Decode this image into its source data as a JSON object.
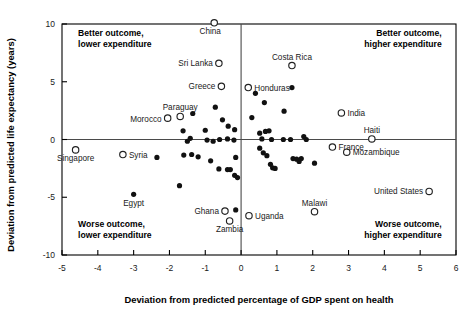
{
  "chart_data": {
    "type": "scatter",
    "title": "",
    "xlabel": "Deviation from predicted percentage of GDP spent on health",
    "ylabel": "Deviation from predicted life expectancy (years)",
    "xlim": [
      -5,
      6
    ],
    "ylim": [
      -10,
      10
    ],
    "xticks": [
      -5,
      -4,
      -3,
      -2,
      -1,
      0,
      1,
      2,
      3,
      4,
      5,
      6
    ],
    "yticks": [
      -10,
      -5,
      0,
      5,
      10
    ],
    "xticklabels": [
      "-5",
      "-4",
      "-3",
      "-2",
      "-1",
      "0",
      "1",
      "2",
      "3",
      "4",
      "5",
      "6"
    ],
    "yticklabels": [
      "-10",
      "-5",
      "0",
      "5",
      "10"
    ],
    "grid": false,
    "legend": null,
    "reference_lines": [
      {
        "axis": "x",
        "value": 0
      },
      {
        "axis": "y",
        "value": 0
      }
    ],
    "annotations": [
      {
        "text": "Better outcome,\nlower expenditure",
        "x": -4.55,
        "y": 9.0,
        "align": "start"
      },
      {
        "text": "Better outcome,\nhigher expenditure",
        "x": 5.6,
        "y": 9.0,
        "align": "end"
      },
      {
        "text": "Worse outcome,\nlower expenditure",
        "x": -4.55,
        "y": -7.6,
        "align": "start"
      },
      {
        "text": "Worse outcome,\nhigher expenditure",
        "x": 5.6,
        "y": -7.6,
        "align": "end"
      }
    ],
    "labeled_points": [
      {
        "name": "China",
        "x": -0.75,
        "y": 10.1,
        "marker": "open",
        "label_pos": "below-left"
      },
      {
        "name": "Sri Lanka",
        "x": -0.62,
        "y": 6.6,
        "marker": "open",
        "label_pos": "left"
      },
      {
        "name": "Costa Rica",
        "x": 1.42,
        "y": 6.4,
        "marker": "open",
        "label_pos": "above"
      },
      {
        "name": "Greece",
        "x": -0.55,
        "y": 4.6,
        "marker": "open",
        "label_pos": "left"
      },
      {
        "name": "Honduras",
        "x": 0.2,
        "y": 4.5,
        "marker": "open",
        "label_pos": "right"
      },
      {
        "name": "India",
        "x": 2.8,
        "y": 2.3,
        "marker": "open",
        "label_pos": "right"
      },
      {
        "name": "Paraguay",
        "x": -1.7,
        "y": 2.0,
        "marker": "open",
        "label_pos": "above"
      },
      {
        "name": "Morocco",
        "x": -2.05,
        "y": 1.85,
        "marker": "open",
        "label_pos": "left-below"
      },
      {
        "name": "Haiti",
        "x": 3.65,
        "y": 0.05,
        "marker": "open",
        "label_pos": "above"
      },
      {
        "name": "France",
        "x": 2.55,
        "y": -0.65,
        "marker": "open",
        "label_pos": "right"
      },
      {
        "name": "Singapore",
        "x": -4.62,
        "y": -0.9,
        "marker": "open",
        "label_pos": "below"
      },
      {
        "name": "Mozambique",
        "x": 2.95,
        "y": -1.1,
        "marker": "open",
        "label_pos": "right"
      },
      {
        "name": "Syria",
        "x": -3.3,
        "y": -1.3,
        "marker": "open",
        "label_pos": "right"
      },
      {
        "name": "United States",
        "x": 5.25,
        "y": -4.5,
        "marker": "open",
        "label_pos": "left"
      },
      {
        "name": "Egypt",
        "x": -3.0,
        "y": -4.75,
        "marker": "filled",
        "label_pos": "below"
      },
      {
        "name": "Ghana",
        "x": -0.45,
        "y": -6.2,
        "marker": "open",
        "label_pos": "left"
      },
      {
        "name": "Malawi",
        "x": 2.05,
        "y": -6.25,
        "marker": "open",
        "label_pos": "above"
      },
      {
        "name": "Uganda",
        "x": 0.22,
        "y": -6.6,
        "marker": "open",
        "label_pos": "right"
      },
      {
        "name": "Zambia",
        "x": -0.32,
        "y": -7.05,
        "marker": "open",
        "label_pos": "below"
      }
    ],
    "unlabeled_points": [
      {
        "x": -1.35,
        "y": 2.25
      },
      {
        "x": -1.0,
        "y": 0.8
      },
      {
        "x": -0.72,
        "y": 2.8
      },
      {
        "x": -0.52,
        "y": 1.7
      },
      {
        "x": -0.36,
        "y": 1.15
      },
      {
        "x": -0.18,
        "y": 0.85
      },
      {
        "x": -0.95,
        "y": -0.05
      },
      {
        "x": -0.78,
        "y": -0.15
      },
      {
        "x": -0.6,
        "y": 0.0
      },
      {
        "x": -0.38,
        "y": 0.05
      },
      {
        "x": -0.2,
        "y": -0.05
      },
      {
        "x": -1.62,
        "y": 0.75
      },
      {
        "x": -1.42,
        "y": 0.1
      },
      {
        "x": -1.5,
        "y": -0.15
      },
      {
        "x": -2.35,
        "y": -1.55
      },
      {
        "x": -1.6,
        "y": -1.35
      },
      {
        "x": -1.38,
        "y": -1.3
      },
      {
        "x": -1.2,
        "y": -1.5
      },
      {
        "x": -0.85,
        "y": -1.85
      },
      {
        "x": -1.72,
        "y": -4.0
      },
      {
        "x": -0.62,
        "y": -2.55
      },
      {
        "x": -0.38,
        "y": -2.6
      },
      {
        "x": -0.3,
        "y": -2.6
      },
      {
        "x": -0.15,
        "y": -1.55
      },
      {
        "x": -0.1,
        "y": -3.3
      },
      {
        "x": -0.18,
        "y": -3.1
      },
      {
        "x": -0.15,
        "y": -6.1
      },
      {
        "x": 0.4,
        "y": 4.0
      },
      {
        "x": 0.65,
        "y": 3.2
      },
      {
        "x": 1.42,
        "y": 4.5
      },
      {
        "x": 1.2,
        "y": 2.45
      },
      {
        "x": 0.3,
        "y": 1.9
      },
      {
        "x": 0.52,
        "y": 0.55
      },
      {
        "x": 0.68,
        "y": 0.7
      },
      {
        "x": 0.78,
        "y": 0.75
      },
      {
        "x": 0.58,
        "y": 0.05
      },
      {
        "x": 0.85,
        "y": 0.0
      },
      {
        "x": 1.18,
        "y": 0.0
      },
      {
        "x": 1.38,
        "y": 0.0
      },
      {
        "x": 1.75,
        "y": 0.25
      },
      {
        "x": 1.82,
        "y": 0.0
      },
      {
        "x": 0.52,
        "y": -0.75
      },
      {
        "x": 0.62,
        "y": -1.15
      },
      {
        "x": 0.72,
        "y": -1.4
      },
      {
        "x": 0.82,
        "y": -2.15
      },
      {
        "x": 0.88,
        "y": -2.45
      },
      {
        "x": 0.95,
        "y": -2.5
      },
      {
        "x": 1.45,
        "y": -1.65
      },
      {
        "x": 1.55,
        "y": -1.7
      },
      {
        "x": 1.62,
        "y": -1.9
      },
      {
        "x": 1.68,
        "y": -1.65
      },
      {
        "x": 2.05,
        "y": -2.05
      }
    ]
  },
  "figure": {
    "xlabel": "Deviation from predicted percentage of GDP spent on health",
    "ylabel": "Deviation from predicted life expectancy (years)"
  }
}
